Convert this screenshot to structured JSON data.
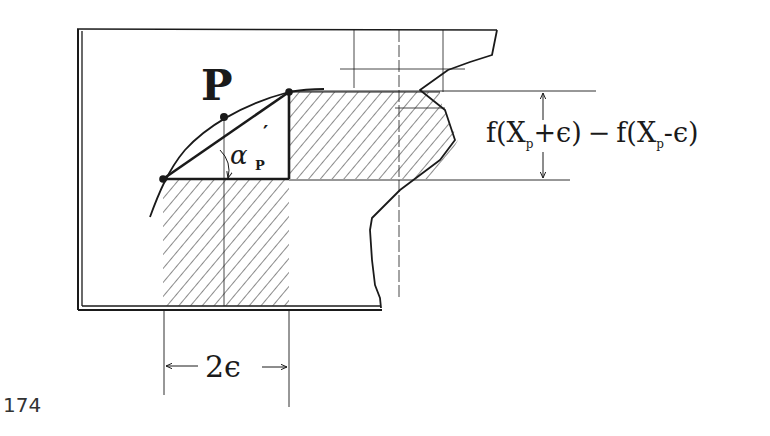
{
  "figure": {
    "point_label": "P",
    "angle_label": "α",
    "angle_subscript": "P",
    "angle_prime": "′",
    "height_label": "f(Xₚ+ϵ) − f(Xₚ−ϵ)",
    "height_label_parts": {
      "f1": "f",
      "open1": "(X",
      "sub1": "p",
      "plus_eps": "+ϵ)",
      "minus": "−",
      "f2": "f",
      "open2": "(X",
      "sub2": "p",
      "minus_eps": "-ϵ)"
    },
    "width_label": "2ϵ",
    "page_number": "174"
  },
  "colors": {
    "ink": "#1a1a1a",
    "hatch": "#2a2a2a",
    "page_number": "#333333"
  }
}
